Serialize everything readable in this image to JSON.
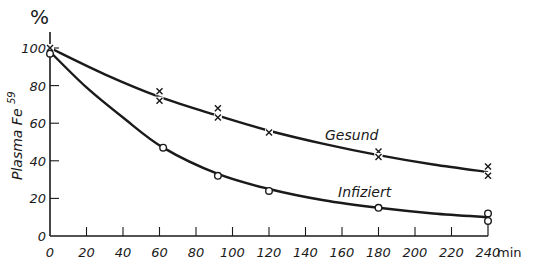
{
  "chart_data": {
    "type": "line",
    "title": "",
    "xlabel": "min",
    "ylabel": "Plasma Fe59",
    "y_unit": "%",
    "xlim": [
      0,
      240
    ],
    "ylim": [
      0,
      100
    ],
    "x_ticks": [
      0,
      20,
      40,
      60,
      80,
      100,
      120,
      140,
      160,
      180,
      200,
      220,
      240
    ],
    "y_ticks": [
      0,
      20,
      40,
      60,
      80,
      100
    ],
    "grid": false,
    "legend": "inline labels",
    "series": [
      {
        "name": "Gesund",
        "marker": "x",
        "points": [
          {
            "x": 0,
            "y": 100
          },
          {
            "x": 60,
            "y": 77
          },
          {
            "x": 60,
            "y": 72
          },
          {
            "x": 92,
            "y": 68
          },
          {
            "x": 92,
            "y": 63
          },
          {
            "x": 120,
            "y": 55
          },
          {
            "x": 180,
            "y": 45
          },
          {
            "x": 180,
            "y": 42
          },
          {
            "x": 240,
            "y": 37
          },
          {
            "x": 240,
            "y": 32
          }
        ],
        "curve": [
          [
            0,
            100
          ],
          [
            30,
            86
          ],
          [
            60,
            74
          ],
          [
            92,
            64
          ],
          [
            120,
            56
          ],
          [
            150,
            49
          ],
          [
            180,
            43
          ],
          [
            210,
            38
          ],
          [
            240,
            34
          ]
        ]
      },
      {
        "name": "Infiziert",
        "marker": "o",
        "points": [
          {
            "x": 0,
            "y": 97
          },
          {
            "x": 62,
            "y": 47
          },
          {
            "x": 92,
            "y": 32
          },
          {
            "x": 120,
            "y": 24
          },
          {
            "x": 180,
            "y": 15
          },
          {
            "x": 240,
            "y": 12
          },
          {
            "x": 240,
            "y": 8
          }
        ],
        "curve": [
          [
            0,
            98
          ],
          [
            20,
            79
          ],
          [
            40,
            63
          ],
          [
            62,
            47
          ],
          [
            92,
            33
          ],
          [
            120,
            25
          ],
          [
            150,
            19
          ],
          [
            180,
            15
          ],
          [
            210,
            12
          ],
          [
            240,
            10
          ]
        ]
      }
    ]
  },
  "labels": {
    "percent": "%",
    "ylabel_main": "Plasma Fe",
    "ylabel_sup": "59",
    "xunit": "min",
    "gesund": "Gesund",
    "infiziert": "Infiziert"
  }
}
